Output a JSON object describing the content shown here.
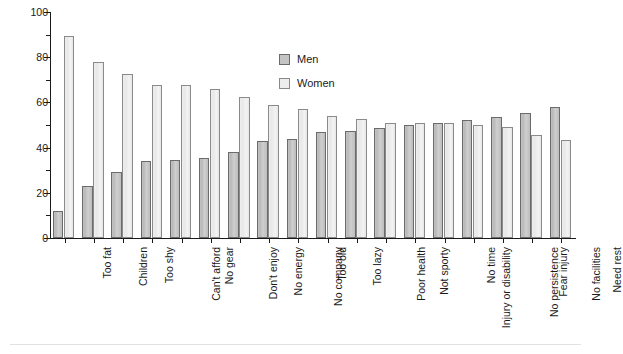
{
  "chart_data": {
    "type": "bar",
    "title": "",
    "xlabel": "",
    "ylabel": "Percentage",
    "ylim": [
      0,
      100
    ],
    "ytick_values": [
      0,
      20,
      40,
      60,
      80,
      100
    ],
    "ytick_labels": [
      "0",
      "20",
      "40",
      "60",
      "80",
      "100"
    ],
    "yminor_tick_values": [
      10,
      30,
      50,
      70,
      90
    ],
    "grid": false,
    "legend_position": "upper-center-right",
    "categories": [
      "Too fat",
      "Children",
      "Too shy",
      "Can't afford",
      "No gear",
      "Don't enjoy",
      "No energy",
      "No company",
      "Too old",
      "Too lazy",
      "Poor health",
      "Not sporty",
      "Injury or disability",
      "No time",
      "No persistence",
      "Fear injury",
      "No facilities",
      "Need rest"
    ],
    "series": [
      {
        "name": "Men",
        "color": "#c4c4c4",
        "values": [
          12,
          23,
          29,
          34,
          34.5,
          35.5,
          38,
          43,
          44,
          47,
          47.5,
          48.5,
          50,
          51,
          52,
          53.5,
          55.5,
          58
        ]
      },
      {
        "name": "Women",
        "color": "#ededed",
        "values": [
          89.5,
          78,
          72.5,
          67.5,
          67.5,
          66,
          62.5,
          59,
          57,
          54,
          52.5,
          51,
          51,
          51,
          50,
          49,
          45.5,
          43.5
        ]
      }
    ]
  },
  "axis": {
    "y_title": "Percentage"
  },
  "legend": {
    "items": [
      {
        "label": "Men"
      },
      {
        "label": "Women"
      }
    ]
  }
}
